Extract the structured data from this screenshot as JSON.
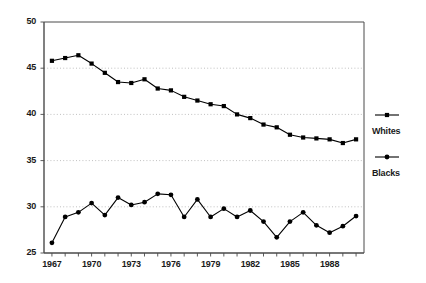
{
  "chart_data": {
    "type": "line",
    "title": "",
    "subtitle": "",
    "xlabel": "",
    "ylabel": "",
    "xlim": [
      1966.4,
      1990.6
    ],
    "ylim": [
      25,
      50
    ],
    "grid": true,
    "grid_axis": "y",
    "legend_position": "right",
    "x": [
      1967,
      1968,
      1969,
      1970,
      1971,
      1972,
      1973,
      1974,
      1975,
      1976,
      1977,
      1978,
      1979,
      1980,
      1981,
      1982,
      1983,
      1984,
      1985,
      1986,
      1987,
      1988,
      1989,
      1990
    ],
    "y_ticks": [
      25,
      30,
      35,
      40,
      45,
      50
    ],
    "y_tick_labels": [
      "25",
      "30",
      "35",
      "40",
      "45",
      "50"
    ],
    "x_ticks": [
      1967,
      1970,
      1973,
      1976,
      1979,
      1982,
      1985,
      1988
    ],
    "x_tick_labels": [
      "1967",
      "1970",
      "1973",
      "1976",
      "1979",
      "1982",
      "1985",
      "1988"
    ],
    "x_minor_ticks": [
      1967,
      1968,
      1969,
      1970,
      1971,
      1972,
      1973,
      1974,
      1975,
      1976,
      1977,
      1978,
      1979,
      1980,
      1981,
      1982,
      1983,
      1984,
      1985,
      1986,
      1987,
      1988,
      1989,
      1990
    ],
    "series": [
      {
        "name": "Whites",
        "marker": "square",
        "color": "#000000",
        "values": [
          45.8,
          46.1,
          46.4,
          45.5,
          44.5,
          43.5,
          43.4,
          43.8,
          42.8,
          42.6,
          41.9,
          41.5,
          41.1,
          40.9,
          40.0,
          39.6,
          38.9,
          38.6,
          37.8,
          37.5,
          37.4,
          37.3,
          36.9,
          37.3
        ]
      },
      {
        "name": "Blacks",
        "marker": "circle",
        "color": "#000000",
        "values": [
          26.1,
          28.9,
          29.4,
          30.4,
          29.1,
          31.0,
          30.2,
          30.5,
          31.4,
          31.3,
          28.9,
          30.8,
          28.9,
          29.8,
          28.9,
          29.6,
          28.4,
          26.7,
          28.4,
          29.4,
          28.0,
          27.2,
          27.9,
          29.0
        ]
      }
    ]
  },
  "legend": {
    "entries": [
      {
        "label": "Whites",
        "marker": "square-marker-icon"
      },
      {
        "label": "Blacks",
        "marker": "circle-marker-icon"
      }
    ]
  },
  "colors": {
    "axis": "#4a4a4a",
    "grid": "#b0b0b0",
    "ink": "#000000",
    "background": "#ffffff"
  }
}
